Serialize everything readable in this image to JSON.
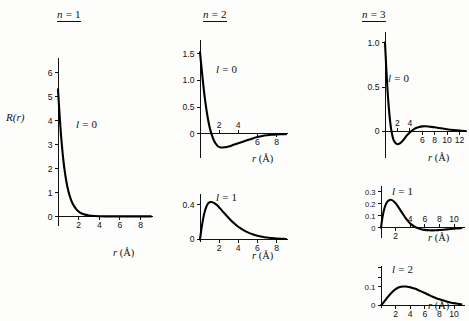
{
  "figure": {
    "y_axis_label": "R(r)",
    "x_axis_label": "r (Å)",
    "columns": [
      {
        "title_n": "n",
        "title_eq": "=",
        "title_value": "1"
      },
      {
        "title_n": "n",
        "title_eq": "=",
        "title_value": "2"
      },
      {
        "title_n": "n",
        "title_eq": "=",
        "title_value": "3"
      }
    ]
  },
  "chart_data": [
    {
      "type": "line",
      "panel_id": "n1-l0",
      "title": "n = 1",
      "annotation": "l = 0",
      "n": 1,
      "l": 0,
      "xlabel": "r (Å)",
      "ylabel": "R(r)",
      "xlim": [
        0,
        9.2
      ],
      "ylim": [
        -0.4,
        6.6
      ],
      "xticks": [
        2,
        4,
        6,
        8
      ],
      "xticklabels": [
        "2",
        "4",
        "6",
        "8"
      ],
      "yticks": [
        0,
        1,
        2,
        3,
        4,
        5,
        6
      ],
      "yticklabels": [
        "0",
        "1",
        "2",
        "3",
        "4",
        "5",
        "6"
      ],
      "grid": false,
      "x": [
        0.0,
        0.15,
        0.3,
        0.5,
        0.7,
        0.9,
        1.1,
        1.3,
        1.5,
        1.8,
        2.1,
        2.5,
        3.0,
        3.5,
        4.0,
        5.0,
        6.0,
        7.0,
        8.0,
        9.0
      ],
      "y": [
        5.3,
        4.25,
        3.35,
        2.42,
        1.74,
        1.25,
        0.9,
        0.65,
        0.47,
        0.28,
        0.17,
        0.085,
        0.035,
        0.014,
        0.006,
        0.001,
        0.0,
        0.0,
        0.0,
        0.0
      ]
    },
    {
      "type": "line",
      "panel_id": "n2-l0",
      "title": "n = 2",
      "annotation": "l = 0",
      "n": 2,
      "l": 0,
      "xlabel": "r (Å)",
      "ylabel": "R(r)",
      "xlim": [
        0,
        9.2
      ],
      "ylim": [
        -0.45,
        1.75
      ],
      "xticks": [
        2,
        4,
        6,
        8
      ],
      "xticklabels": [
        "2",
        "4",
        "6",
        "8"
      ],
      "yticks": [
        0,
        0.5,
        1.0,
        1.5
      ],
      "yticklabels": [
        "0",
        "0.5",
        "1.0",
        "1.5"
      ],
      "grid": false,
      "x": [
        0.0,
        0.2,
        0.4,
        0.6,
        0.8,
        1.0,
        1.2,
        1.4,
        1.6,
        1.9,
        2.2,
        2.6,
        3.0,
        3.5,
        4.0,
        4.5,
        5.0,
        5.5,
        6.0,
        6.5,
        7.0,
        7.5,
        8.0,
        9.0
      ],
      "y": [
        1.52,
        1.16,
        0.82,
        0.54,
        0.31,
        0.13,
        0.0,
        -0.1,
        -0.17,
        -0.235,
        -0.255,
        -0.25,
        -0.235,
        -0.205,
        -0.175,
        -0.145,
        -0.115,
        -0.085,
        -0.06,
        -0.04,
        -0.026,
        -0.016,
        -0.01,
        -0.004
      ]
    },
    {
      "type": "line",
      "panel_id": "n2-l1",
      "title": "n = 2",
      "annotation": "l = 1",
      "n": 2,
      "l": 1,
      "xlabel": "r (Å)",
      "ylabel": "R(r)",
      "xlim": [
        0,
        9.2
      ],
      "ylim": [
        -0.03,
        0.52
      ],
      "xticks": [
        2,
        4,
        6,
        8
      ],
      "xticklabels": [
        "2",
        "4",
        "6",
        "8"
      ],
      "yticks": [
        0,
        0.4
      ],
      "yticklabels": [
        "0",
        "0.4"
      ],
      "grid": false,
      "x": [
        0.0,
        0.2,
        0.4,
        0.6,
        0.8,
        1.0,
        1.2,
        1.5,
        1.8,
        2.1,
        2.5,
        3.0,
        3.5,
        4.0,
        4.5,
        5.0,
        5.5,
        6.0,
        6.5,
        7.0,
        7.5,
        8.0,
        8.5,
        9.0
      ],
      "y": [
        0.0,
        0.155,
        0.275,
        0.355,
        0.405,
        0.425,
        0.428,
        0.415,
        0.39,
        0.355,
        0.305,
        0.245,
        0.19,
        0.145,
        0.11,
        0.08,
        0.058,
        0.042,
        0.03,
        0.021,
        0.015,
        0.01,
        0.007,
        0.005
      ]
    },
    {
      "type": "line",
      "panel_id": "n3-l0",
      "title": "n = 3",
      "annotation": "l = 0",
      "n": 3,
      "l": 0,
      "xlabel": "r (Å)",
      "ylabel": "R(r)",
      "xlim": [
        0,
        13.2
      ],
      "ylim": [
        -0.3,
        1.12
      ],
      "xticks": [
        2,
        4,
        6,
        8,
        10,
        12
      ],
      "xticklabels": [
        "2",
        "4",
        "6",
        "8",
        "10",
        "12"
      ],
      "yticks": [
        0,
        0.5,
        1.0
      ],
      "yticklabels": [
        "0",
        "0.5",
        "1.0"
      ],
      "grid": false,
      "x": [
        0.0,
        0.2,
        0.4,
        0.6,
        0.8,
        1.0,
        1.3,
        1.6,
        2.0,
        2.4,
        2.8,
        3.2,
        3.6,
        4.0,
        4.5,
        5.0,
        5.5,
        6.0,
        6.5,
        7.0,
        7.5,
        8.0,
        9.0,
        10.0,
        11.0,
        12.0,
        13.0
      ],
      "y": [
        1.0,
        0.72,
        0.47,
        0.28,
        0.13,
        0.02,
        -0.08,
        -0.125,
        -0.145,
        -0.135,
        -0.11,
        -0.075,
        -0.04,
        -0.012,
        0.018,
        0.038,
        0.05,
        0.056,
        0.057,
        0.055,
        0.051,
        0.046,
        0.035,
        0.024,
        0.015,
        0.008,
        0.004
      ]
    },
    {
      "type": "line",
      "panel_id": "n3-l1",
      "title": "n = 3",
      "annotation": "l = 1",
      "n": 3,
      "l": 1,
      "xlabel": "r (Å)",
      "ylabel": "R(r)",
      "xlim": [
        0,
        11.5
      ],
      "ylim": [
        -0.085,
        0.345
      ],
      "xticks": [
        2,
        4,
        6,
        8,
        10
      ],
      "xticklabels": [
        "2",
        "4",
        "6",
        "8",
        "10"
      ],
      "yticks": [
        0,
        0.1,
        0.2,
        0.3
      ],
      "yticklabels": [
        "0",
        "0.1",
        "0.2",
        "0.3"
      ],
      "grid": false,
      "x": [
        0.0,
        0.2,
        0.4,
        0.6,
        0.9,
        1.2,
        1.5,
        1.8,
        2.1,
        2.5,
        2.9,
        3.3,
        3.7,
        4.1,
        4.5,
        5.0,
        5.5,
        6.0,
        6.5,
        7.0,
        7.5,
        8.0,
        8.5,
        9.0,
        9.5,
        10.0,
        10.5,
        11.0
      ],
      "y": [
        0.0,
        0.085,
        0.145,
        0.185,
        0.218,
        0.23,
        0.228,
        0.215,
        0.195,
        0.16,
        0.122,
        0.086,
        0.055,
        0.03,
        0.012,
        -0.003,
        -0.012,
        -0.018,
        -0.021,
        -0.022,
        -0.021,
        -0.019,
        -0.017,
        -0.014,
        -0.011,
        -0.008,
        -0.005,
        -0.003
      ]
    },
    {
      "type": "line",
      "panel_id": "n3-l2",
      "title": "n = 3",
      "annotation": "l = 2",
      "n": 3,
      "l": 2,
      "xlabel": "r (Å)",
      "ylabel": "R(r)",
      "xlim": [
        0,
        11.5
      ],
      "ylim": [
        -0.015,
        0.21
      ],
      "xticks": [
        2,
        4,
        6,
        8,
        10
      ],
      "xticklabels": [
        "2",
        "4",
        "6",
        "8",
        "10"
      ],
      "yticks": [
        0,
        0.1
      ],
      "yticklabels": [
        "0",
        "0.1"
      ],
      "grid": false,
      "x": [
        0.0,
        0.3,
        0.6,
        1.0,
        1.4,
        1.8,
        2.2,
        2.6,
        3.0,
        3.4,
        3.8,
        4.2,
        4.6,
        5.0,
        5.5,
        6.0,
        6.5,
        7.0,
        7.5,
        8.0,
        8.5,
        9.0,
        9.5,
        10.0,
        10.5,
        11.0
      ],
      "y": [
        0.0,
        0.012,
        0.027,
        0.047,
        0.065,
        0.08,
        0.091,
        0.097,
        0.1,
        0.1,
        0.098,
        0.094,
        0.089,
        0.083,
        0.074,
        0.065,
        0.056,
        0.047,
        0.039,
        0.032,
        0.026,
        0.02,
        0.015,
        0.011,
        0.008,
        0.005
      ]
    }
  ],
  "panels": [
    {
      "id": "n1-l0",
      "annotation_l": "l",
      "annotation_eq": "=",
      "annotation_value": "0",
      "xlabel_r": "r",
      "xlabel_unit": "(Å)"
    },
    {
      "id": "n2-l0",
      "annotation_l": "l",
      "annotation_eq": "=",
      "annotation_value": "0",
      "xlabel_r": "r",
      "xlabel_unit": "(Å)"
    },
    {
      "id": "n2-l1",
      "annotation_l": "l",
      "annotation_eq": "=",
      "annotation_value": "1",
      "xlabel_r": "r",
      "xlabel_unit": "(Å)"
    },
    {
      "id": "n3-l0",
      "annotation_l": "l",
      "annotation_eq": "=",
      "annotation_value": "0",
      "xlabel_r": "r",
      "xlabel_unit": "(Å)"
    },
    {
      "id": "n3-l1",
      "annotation_l": "l",
      "annotation_eq": "=",
      "annotation_value": "1",
      "xlabel_r": "r",
      "xlabel_unit": "(Å)"
    },
    {
      "id": "n3-l2",
      "annotation_l": "l",
      "annotation_eq": "=",
      "annotation_value": "2",
      "xlabel_r": "r",
      "xlabel_unit": "(Å)"
    }
  ]
}
